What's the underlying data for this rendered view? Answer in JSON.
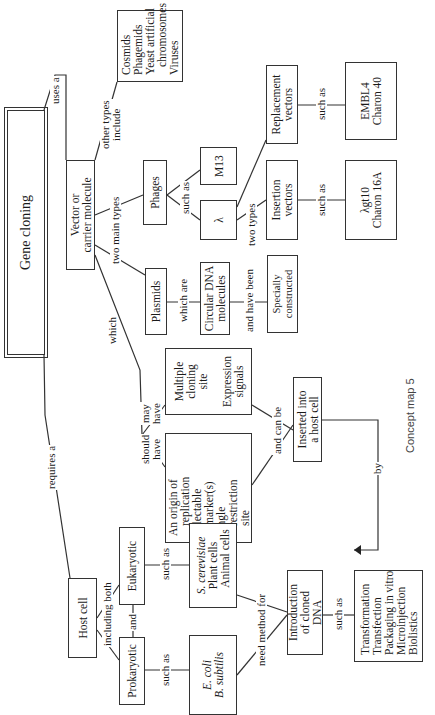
{
  "caption": "Concept map 5",
  "nodes": {
    "gene_cloning": {
      "lines": [
        "Gene cloning"
      ]
    },
    "vector": {
      "lines": [
        "Vector or",
        "carrier molecule"
      ]
    },
    "other_vectors": {
      "lines": [
        "Cosmids",
        "Phagemids",
        "Yeast artificial",
        "chromosomes",
        "Viruses"
      ]
    },
    "phages": {
      "lines": [
        "Phages"
      ]
    },
    "m13": {
      "lines": [
        "M13"
      ]
    },
    "lambda": {
      "lines": [
        "λ"
      ]
    },
    "replacement_vectors": {
      "lines": [
        "Replacement",
        "vectors"
      ]
    },
    "insertion_vectors": {
      "lines": [
        "Insertion",
        "vectors"
      ]
    },
    "replacement_examples": {
      "lines": [
        "EMBL4",
        "Charon 40"
      ]
    },
    "insertion_examples": {
      "lines": [
        "λgt10",
        "Charon 16A"
      ]
    },
    "plasmids": {
      "lines": [
        "Plasmids"
      ]
    },
    "circular_dna": {
      "lines": [
        "Circular DNA",
        "molecules"
      ]
    },
    "specially_constructed": {
      "lines": [
        "Specially",
        "constructed"
      ]
    },
    "may_have": {
      "lines": [
        "Multiple",
        "cloning",
        "site",
        "",
        "Expression",
        "signals"
      ]
    },
    "should_have": {
      "lines": [
        "An origin of",
        "replication",
        "Selectable",
        "marker(s)",
        "Single",
        "restriction",
        "site"
      ]
    },
    "inserted": {
      "lines": [
        "Inserted into",
        "a host cell"
      ]
    },
    "host_cell": {
      "lines": [
        "Host cell"
      ]
    },
    "eukaryotic": {
      "lines": [
        "Eukaryotic"
      ]
    },
    "prokaryotic": {
      "lines": [
        "Prokaryotic"
      ]
    },
    "eukaryotic_examples": {
      "lines": [
        "S. cerevisiae",
        "Plant cells",
        "Animal cells"
      ]
    },
    "prokaryotic_examples": {
      "lines": [
        "E. coli",
        "B. subtilis"
      ]
    },
    "introduction": {
      "lines": [
        "Introduction",
        "of cloned",
        "DNA"
      ]
    },
    "methods": {
      "lines": [
        "Transformation",
        "Transfection",
        "Packaging in vitro",
        "Microinjection",
        "Biolistics"
      ]
    }
  },
  "links": {
    "uses_a": "uses a",
    "requires_a": "requires a",
    "other_types_include": [
      "other types",
      "include"
    ],
    "two_main_types": "two main types",
    "which": "which",
    "such_as_phages": "such as",
    "two_types": "two types",
    "such_as_replacement": "such as",
    "such_as_insertion": "such as",
    "which_are": "which are",
    "and_have_been": "and have been",
    "may_have": [
      "may",
      "have"
    ],
    "should_have": [
      "should",
      "have"
    ],
    "and_can_be": "and can be",
    "by": "by",
    "including_both": "including both",
    "and": "and",
    "such_as_eukaryotic": "such as",
    "such_as_prokaryotic": "such as",
    "need_method_for": "need method for",
    "such_as_introduction": "such as"
  }
}
